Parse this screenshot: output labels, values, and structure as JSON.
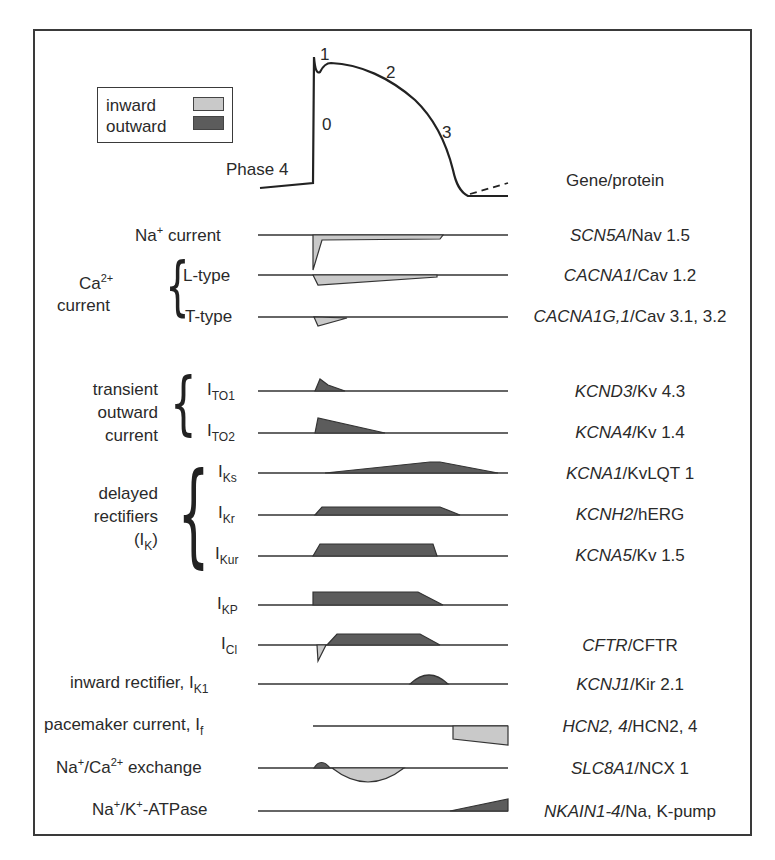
{
  "legend": {
    "inward_label": "inward",
    "outward_label": "outward",
    "inward_color": "#c9c9c9",
    "outward_color": "#5c5c5c"
  },
  "action_potential": {
    "phase_labels": {
      "p0": "0",
      "p1": "1",
      "p2": "2",
      "p3": "3",
      "p4": "Phase 4"
    }
  },
  "header": {
    "gene_protein": "Gene/protein"
  },
  "groups": {
    "calcium": {
      "label_main": "Ca",
      "label_sup": "2+",
      "label_line2": "current"
    },
    "transient": {
      "line1": "transient",
      "line2": "outward",
      "line3": "current"
    },
    "delayed": {
      "line1": "delayed",
      "line2": "rectifiers",
      "line3_prefix": "(I",
      "line3_sub": "K",
      "line3_suffix": ")"
    }
  },
  "currents": [
    {
      "id": "na",
      "label": "Na",
      "sup": "+",
      "label_rest": " current",
      "gene": "SCN5A",
      "protein": "/Nav 1.5"
    },
    {
      "id": "ltype",
      "label": "L-type",
      "gene": "CACNA1",
      "protein": "/Cav 1.2"
    },
    {
      "id": "ttype",
      "label": "T-type",
      "gene": "CACNA1G,1",
      "protein": "/Cav 3.1, 3.2"
    },
    {
      "id": "ito1",
      "label": "I",
      "sub": "TO1",
      "gene": "KCND3",
      "protein": "/Kv 4.3"
    },
    {
      "id": "ito2",
      "label": "I",
      "sub": "TO2",
      "gene": "KCNA4",
      "protein": "/Kv 1.4"
    },
    {
      "id": "iks",
      "label": "I",
      "sub": "Ks",
      "gene": "KCNA1",
      "protein": "/KvLQT 1"
    },
    {
      "id": "ikr",
      "label": "I",
      "sub": "Kr",
      "gene": "KCNH2",
      "protein": "/hERG"
    },
    {
      "id": "ikur",
      "label": "I",
      "sub": "Kur",
      "gene": "KCNA5",
      "protein": "/Kv 1.5"
    },
    {
      "id": "ikp",
      "label": "I",
      "sub": "KP",
      "gene": "",
      "protein": ""
    },
    {
      "id": "icl",
      "label": "I",
      "sub": "Cl",
      "gene": "CFTR",
      "protein": "/CFTR"
    },
    {
      "id": "ik1",
      "label": "inward rectifier, I",
      "sub": "K1",
      "gene": "KCNJ1",
      "protein": "/Kir 2.1"
    },
    {
      "id": "if",
      "label": "pacemaker current, I",
      "sub": "f",
      "gene": "HCN2, 4",
      "protein": "/HCN2, 4"
    },
    {
      "id": "ncx",
      "label": "Na",
      "sup": "+",
      "label_mid": "/Ca",
      "sup2": "2+",
      "label_rest": " exchange",
      "gene": "SLC8A1",
      "protein": "/NCX 1"
    },
    {
      "id": "nak",
      "label": "Na",
      "sup": "+",
      "label_mid": "/K",
      "sup2": "+",
      "label_rest": "-ATPase",
      "gene": "NKAIN1-4",
      "protein": "/Na, K-pump"
    }
  ]
}
